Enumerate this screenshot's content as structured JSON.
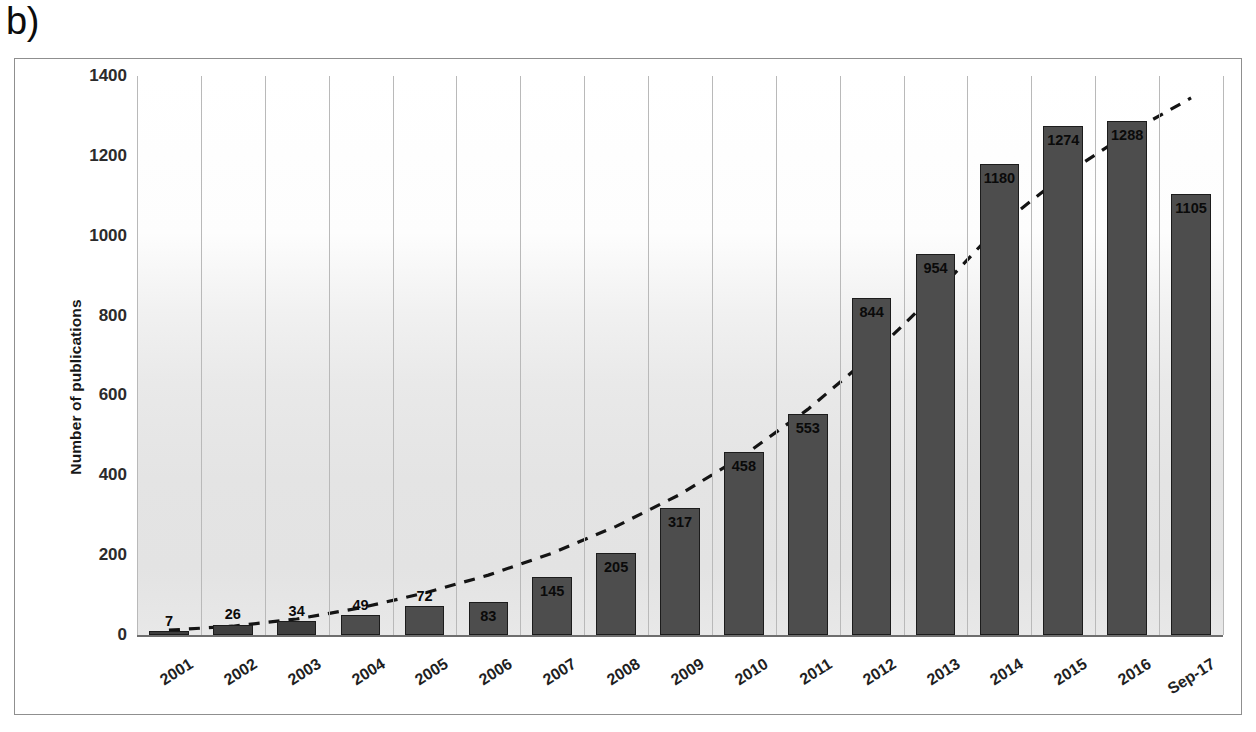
{
  "panel": {
    "label": "b)"
  },
  "chart_data": {
    "type": "bar",
    "title": "",
    "xlabel": "",
    "ylabel": "Number of publications",
    "ylim": [
      0,
      1400
    ],
    "yticks": [
      0,
      200,
      400,
      600,
      800,
      1000,
      1200,
      1400
    ],
    "ytick_labels": [
      "0",
      "200",
      "400",
      "600",
      "800",
      "1000",
      "1200",
      "1400"
    ],
    "grid": "vertical",
    "legend": "none",
    "categories": [
      "2001",
      "2002",
      "2003",
      "2004",
      "2005",
      "2006",
      "2007",
      "2008",
      "2009",
      "2010",
      "2011",
      "2012",
      "2013",
      "2014",
      "2015",
      "2016",
      "Sep-17"
    ],
    "values": [
      7,
      26,
      34,
      49,
      72,
      83,
      145,
      205,
      317,
      458,
      553,
      844,
      954,
      1180,
      1274,
      1288,
      1105
    ],
    "value_labels": [
      "7",
      "26",
      "34",
      "49",
      "72",
      "83",
      "145",
      "205",
      "317",
      "458",
      "553",
      "844",
      "954",
      "1180",
      "1274",
      "1288",
      "1105"
    ],
    "series": [
      {
        "name": "Number of publications",
        "values": [
          7,
          26,
          34,
          49,
          72,
          83,
          145,
          205,
          317,
          458,
          553,
          844,
          954,
          1180,
          1274,
          1288,
          1105
        ]
      }
    ],
    "trendline": {
      "type": "exponential-dashed",
      "style": "dashed",
      "color": "#141414",
      "points": [
        {
          "x": "2001",
          "y": 12
        },
        {
          "x": "2002",
          "y": 22
        },
        {
          "x": "2003",
          "y": 40
        },
        {
          "x": "2004",
          "y": 68
        },
        {
          "x": "2005",
          "y": 105
        },
        {
          "x": "2006",
          "y": 150
        },
        {
          "x": "2007",
          "y": 205
        },
        {
          "x": "2008",
          "y": 272
        },
        {
          "x": "2009",
          "y": 352
        },
        {
          "x": "2010",
          "y": 450
        },
        {
          "x": "2011",
          "y": 565
        },
        {
          "x": "2012",
          "y": 700
        },
        {
          "x": "2013",
          "y": 855
        },
        {
          "x": "2014",
          "y": 1025
        },
        {
          "x": "2015",
          "y": 1150
        },
        {
          "x": "2016",
          "y": 1255
        },
        {
          "x": "Sep-17",
          "y": 1345
        }
      ]
    },
    "colors": {
      "bar_fill": "#4d4d4d",
      "bar_edge": "#1c1c1c",
      "gridline": "#b9b9b9",
      "label_text": "#0a0a0a",
      "trendline": "#141414"
    }
  }
}
